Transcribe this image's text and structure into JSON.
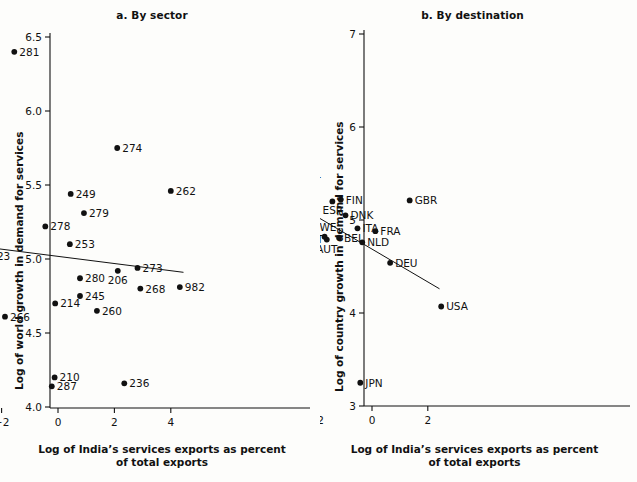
{
  "figure": {
    "xlabel_line1": "Log of India’s services exports as percent",
    "xlabel_line2": "of total exports"
  },
  "chart_data": [
    {
      "id": "panel-a",
      "type": "scatter",
      "title": "a. By sector",
      "xlabel": "Log of India’s services exports as percent of total exports",
      "ylabel": "Log of world growth in demand for services",
      "xlim": [
        -4.9,
        5.0
      ],
      "ylim": [
        3.92,
        6.62
      ],
      "xticks": [
        -4,
        -2,
        0,
        2,
        4
      ],
      "xticklabels": [
        "−4",
        "−2",
        "0",
        "2",
        "4"
      ],
      "yticks": [
        4.0,
        4.5,
        5.0,
        5.5,
        6.0,
        6.5
      ],
      "yticklabels": [
        "4.0",
        "4.5",
        "5.0",
        "5.5",
        "6.0",
        "6.5"
      ],
      "grid": false,
      "legend": false,
      "fit_line": {
        "x0": -3.8,
        "y0": 5.11,
        "x1": 4.45,
        "y1": 4.91
      },
      "points": [
        {
          "label": "281",
          "x": -1.55,
          "y": 6.4,
          "lp": "right"
        },
        {
          "label": "274",
          "x": 2.1,
          "y": 5.75,
          "lp": "right"
        },
        {
          "label": "262",
          "x": 4.0,
          "y": 5.46,
          "lp": "right"
        },
        {
          "label": "249",
          "x": 0.45,
          "y": 5.44,
          "lp": "right"
        },
        {
          "label": "279",
          "x": 0.92,
          "y": 5.31,
          "lp": "right"
        },
        {
          "label": "278",
          "x": -0.45,
          "y": 5.22,
          "lp": "right"
        },
        {
          "label": "219",
          "x": -3.6,
          "y": 5.2,
          "lp": "right"
        },
        {
          "label": "253",
          "x": 0.42,
          "y": 5.1,
          "lp": "right"
        },
        {
          "label": "223",
          "x": -2.58,
          "y": 5.02,
          "lp": "right"
        },
        {
          "label": "273",
          "x": 2.82,
          "y": 4.94,
          "lp": "right"
        },
        {
          "label": "206",
          "x": 2.12,
          "y": 4.92,
          "lp": "below"
        },
        {
          "label": "280",
          "x": 0.78,
          "y": 4.87,
          "lp": "right"
        },
        {
          "label": "982",
          "x": 4.32,
          "y": 4.81,
          "lp": "right"
        },
        {
          "label": "268",
          "x": 2.92,
          "y": 4.8,
          "lp": "right"
        },
        {
          "label": "245",
          "x": 0.78,
          "y": 4.75,
          "lp": "right"
        },
        {
          "label": "214",
          "x": -0.1,
          "y": 4.7,
          "lp": "right"
        },
        {
          "label": "260",
          "x": 1.38,
          "y": 4.65,
          "lp": "right"
        },
        {
          "label": "266",
          "x": -1.88,
          "y": 4.61,
          "lp": "right"
        },
        {
          "label": "210",
          "x": -0.12,
          "y": 4.2,
          "lp": "right"
        },
        {
          "label": "287",
          "x": -0.22,
          "y": 4.14,
          "lp": "right"
        },
        {
          "label": "236",
          "x": 2.35,
          "y": 4.16,
          "lp": "right"
        }
      ]
    },
    {
      "id": "panel-b",
      "type": "scatter",
      "title": "b. By destination",
      "xlabel": "Log of India’s services exports as percent of total exports",
      "ylabel": "Log of country growth in demand for services",
      "xlim": [
        -6.9,
        3.1
      ],
      "ylim": [
        2.9,
        7.12
      ],
      "xticks": [
        -6,
        -4,
        -2,
        0,
        2
      ],
      "xticklabels": [
        "−6",
        "−4",
        "−2",
        "0",
        "2"
      ],
      "yticks": [
        3,
        4,
        5,
        6,
        7
      ],
      "yticklabels": [
        "3",
        "4",
        "5",
        "6",
        "7"
      ],
      "grid": false,
      "legend": false,
      "fit_line": {
        "x0": -5.4,
        "y0": 5.64,
        "x1": 2.42,
        "y1": 4.26
      },
      "points": [
        {
          "label": "LTU",
          "x": -4.75,
          "y": 6.24,
          "lp": "above"
        },
        {
          "label": "CYP",
          "x": -4.58,
          "y": 6.2,
          "lp": "below"
        },
        {
          "label": "ROM",
          "x": -4.25,
          "y": 6.21,
          "lp": "right"
        },
        {
          "label": "SVK",
          "x": -5.28,
          "y": 6.0,
          "lp": "right"
        },
        {
          "label": "LVA",
          "x": -4.42,
          "y": 5.73,
          "lp": "right"
        },
        {
          "label": "BGR",
          "x": -5.42,
          "y": 5.64,
          "lp": "left"
        },
        {
          "label": "SVN",
          "x": -5.0,
          "y": 5.55,
          "lp": "right"
        },
        {
          "label": "EST",
          "x": -5.2,
          "y": 5.52,
          "lp": "left"
        },
        {
          "label": "MLT",
          "x": -4.95,
          "y": 5.47,
          "lp": "below"
        },
        {
          "label": "HUN",
          "x": -3.48,
          "y": 5.53,
          "lp": "right"
        },
        {
          "label": "IRL",
          "x": -2.6,
          "y": 5.5,
          "lp": "right"
        },
        {
          "label": "CZE",
          "x": -3.35,
          "y": 5.4,
          "lp": "right"
        },
        {
          "label": "POL",
          "x": -3.12,
          "y": 5.33,
          "lp": "below"
        },
        {
          "label": "FIN",
          "x": -1.12,
          "y": 5.22,
          "lp": "right"
        },
        {
          "label": "ESP",
          "x": -1.42,
          "y": 5.2,
          "lp": "below"
        },
        {
          "label": "GBR",
          "x": 1.35,
          "y": 5.21,
          "lp": "right"
        },
        {
          "label": "NOR",
          "x": -2.88,
          "y": 5.13,
          "lp": "right"
        },
        {
          "label": "HRV",
          "x": -4.6,
          "y": 5.11,
          "lp": "right"
        },
        {
          "label": "LUX",
          "x": -2.9,
          "y": 5.07,
          "lp": "below"
        },
        {
          "label": "DNK",
          "x": -0.95,
          "y": 5.05,
          "lp": "right"
        },
        {
          "label": "ITA",
          "x": -0.52,
          "y": 4.91,
          "lp": "right"
        },
        {
          "label": "FRA",
          "x": 0.12,
          "y": 4.88,
          "lp": "right"
        },
        {
          "label": "SWE",
          "x": -1.7,
          "y": 4.82,
          "lp": "above"
        },
        {
          "label": "PRT",
          "x": -2.62,
          "y": 4.8,
          "lp": "right"
        },
        {
          "label": "BEL",
          "x": -1.18,
          "y": 4.81,
          "lp": "right"
        },
        {
          "label": "AUT",
          "x": -1.62,
          "y": 4.79,
          "lp": "below"
        },
        {
          "label": "NLD",
          "x": -0.35,
          "y": 4.76,
          "lp": "right"
        },
        {
          "label": "DEU",
          "x": 0.65,
          "y": 4.54,
          "lp": "right"
        },
        {
          "label": "TUR",
          "x": -5.38,
          "y": 4.33,
          "lp": "right"
        },
        {
          "label": "USA",
          "x": 2.48,
          "y": 4.07,
          "lp": "right"
        },
        {
          "label": "JPN",
          "x": -0.42,
          "y": 3.25,
          "lp": "right"
        }
      ]
    }
  ]
}
